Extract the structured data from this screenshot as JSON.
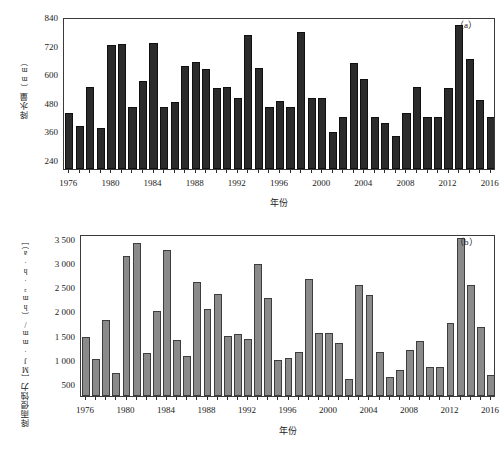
{
  "figure": {
    "background": "#ffffff",
    "panels": [
      {
        "tag": "（a）",
        "ylabel_main": "降水量",
        "ylabel_unit": "（mm）",
        "xlabel": "年份"
      },
      {
        "tag": "（b）",
        "ylabel_main": "降雨侵蚀力",
        "ylabel_unit": "［MJ·mm/（hm²·h·a）］",
        "xlabel": "年份"
      }
    ]
  },
  "chart_data": [
    {
      "type": "bar",
      "panel": "a",
      "title": "",
      "xlabel": "年份",
      "ylabel": "降水量（mm）",
      "ylim": [
        200,
        840
      ],
      "yticks": [
        240,
        360,
        480,
        600,
        720,
        840
      ],
      "ytick_labels": [
        "240",
        "360",
        "480",
        "600",
        "720",
        "840"
      ],
      "xticks": [
        1976,
        1980,
        1984,
        1988,
        1992,
        1996,
        2000,
        2004,
        2008,
        2012,
        2016
      ],
      "xtick_labels": [
        "1976",
        "1980",
        "1984",
        "1988",
        "1992",
        "1996",
        "2000",
        "2004",
        "2008",
        "2012",
        "2016"
      ],
      "grid": false,
      "legend": "none",
      "bar_color": "#2b2b2b",
      "categories": [
        1976,
        1977,
        1978,
        1979,
        1980,
        1981,
        1982,
        1983,
        1984,
        1985,
        1986,
        1987,
        1988,
        1989,
        1990,
        1991,
        1992,
        1993,
        1994,
        1995,
        1996,
        1997,
        1998,
        1999,
        2000,
        2001,
        2002,
        2003,
        2004,
        2005,
        2006,
        2007,
        2008,
        2009,
        2010,
        2011,
        2012,
        2013,
        2014,
        2015,
        2016
      ],
      "values": [
        437,
        382,
        546,
        374,
        721,
        725,
        461,
        571,
        731,
        461,
        484,
        634,
        649,
        621,
        540,
        546,
        498,
        765,
        627,
        461,
        488,
        461,
        775,
        499,
        498,
        357,
        417,
        645,
        581,
        417,
        392,
        341,
        437,
        546,
        417,
        417,
        540,
        806,
        665,
        492,
        418
      ]
    },
    {
      "type": "bar",
      "panel": "b",
      "title": "",
      "xlabel": "年份",
      "ylabel": "降雨侵蚀力［MJ·mm/（hm²·h·a）］",
      "ylim": [
        250,
        3600
      ],
      "yticks": [
        500,
        1000,
        1500,
        2000,
        2500,
        3000,
        3500
      ],
      "ytick_labels": [
        "500",
        "1 000",
        "1 500",
        "2 000",
        "2 500",
        "3 000",
        "3 500"
      ],
      "xticks": [
        1976,
        1980,
        1984,
        1988,
        1992,
        1996,
        2000,
        2004,
        2008,
        2012,
        2016
      ],
      "xtick_labels": [
        "1976",
        "1980",
        "1984",
        "1988",
        "1992",
        "1996",
        "2000",
        "2004",
        "2008",
        "2012",
        "2016"
      ],
      "grid": false,
      "legend": "none",
      "bar_color": "#8a8a8a",
      "categories": [
        1976,
        1977,
        1978,
        1979,
        1980,
        1981,
        1982,
        1983,
        1984,
        1985,
        1986,
        1987,
        1988,
        1989,
        1990,
        1991,
        1992,
        1993,
        1994,
        1995,
        1996,
        1997,
        1998,
        1999,
        2000,
        2001,
        2002,
        2003,
        2004,
        2005,
        2006,
        2007,
        2008,
        2009,
        2010,
        2011,
        2012,
        2013,
        2014,
        2015,
        2016
      ],
      "values": [
        1470,
        1010,
        1830,
        720,
        3140,
        3420,
        1130,
        2010,
        3270,
        1400,
        1080,
        2610,
        2050,
        2350,
        1500,
        1540,
        1430,
        2990,
        2280,
        1000,
        1030,
        1170,
        2680,
        1560,
        1560,
        1340,
        600,
        2540,
        2330,
        1170,
        640,
        780,
        1200,
        1380,
        840,
        850,
        1760,
        3520,
        2540,
        1680,
        690
      ]
    }
  ]
}
